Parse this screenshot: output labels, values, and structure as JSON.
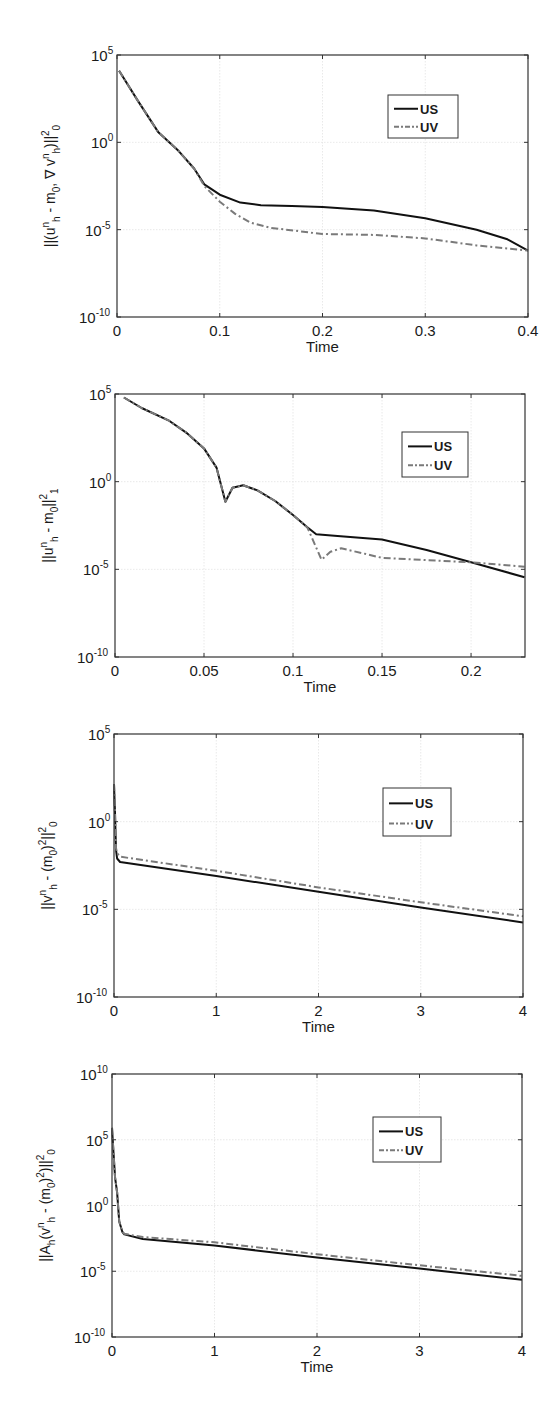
{
  "chart_data": [
    {
      "type": "line",
      "id": "chart1",
      "title": "",
      "xlabel": "Time",
      "ylabel": "||(u_h^n - m_0, ∇ v_h^n)||_0^2",
      "ylabel_parts": [
        {
          "t": "||(u",
          "s": "n"
        },
        {
          "t": "h",
          "sub": true
        },
        {
          "t": " - m"
        },
        {
          "t": "0",
          "sub": true
        },
        {
          "t": ", ∇ v",
          "s": "n"
        },
        {
          "t": "h",
          "sub": true
        },
        {
          "t": ")||",
          "s": "2"
        },
        {
          "t": "0",
          "sub": true
        }
      ],
      "yscale": "log",
      "xlim": [
        0,
        0.4
      ],
      "ylim_exp": [
        -10,
        5
      ],
      "xticks": [
        0,
        0.1,
        0.2,
        0.3,
        0.4
      ],
      "xtick_labels": [
        "0",
        "0.1",
        "0.2",
        "0.3",
        "0.4"
      ],
      "yticks_exp": [
        -10,
        -5,
        0,
        5
      ],
      "grid": true,
      "legend": {
        "position": "upper right",
        "entries": [
          "US",
          "UV"
        ]
      },
      "frame": {
        "x": 117,
        "y": 55,
        "w": 411,
        "h": 262
      },
      "legend_box": {
        "x": 388,
        "y": 95,
        "w": 70,
        "h": 43
      },
      "series": [
        {
          "name": "US",
          "style": "solid",
          "color": "#111111",
          "x": [
            0.002,
            0.02,
            0.04,
            0.06,
            0.075,
            0.085,
            0.1,
            0.12,
            0.14,
            0.17,
            0.2,
            0.25,
            0.3,
            0.35,
            0.38,
            0.4
          ],
          "log10y": [
            4.1,
            2.4,
            0.6,
            -0.5,
            -1.5,
            -2.4,
            -3.0,
            -3.45,
            -3.6,
            -3.65,
            -3.7,
            -3.9,
            -4.35,
            -5.0,
            -5.55,
            -6.2
          ]
        },
        {
          "name": "UV",
          "style": "dashdot",
          "color": "#7a7a7a",
          "x": [
            0.002,
            0.02,
            0.04,
            0.06,
            0.075,
            0.085,
            0.1,
            0.115,
            0.13,
            0.15,
            0.2,
            0.25,
            0.3,
            0.35,
            0.4
          ],
          "log10y": [
            4.1,
            2.4,
            0.6,
            -0.5,
            -1.5,
            -2.5,
            -3.4,
            -4.1,
            -4.6,
            -4.9,
            -5.25,
            -5.3,
            -5.5,
            -5.9,
            -6.2
          ]
        }
      ]
    },
    {
      "type": "line",
      "id": "chart2",
      "title": "",
      "xlabel": "Time",
      "ylabel": "||u_h^n - m_0||_1^2",
      "ylabel_parts": [
        {
          "t": "||u",
          "s": "n"
        },
        {
          "t": "h",
          "sub": true
        },
        {
          "t": " - m"
        },
        {
          "t": "0",
          "sub": true
        },
        {
          "t": "||",
          "s": "2"
        },
        {
          "t": "1",
          "sub": true
        }
      ],
      "yscale": "log",
      "xlim": [
        0,
        0.2303
      ],
      "ylim_exp": [
        -10,
        5
      ],
      "xticks": [
        0,
        0.05,
        0.1,
        0.15,
        0.2
      ],
      "xtick_labels": [
        "0",
        "0.05",
        "0.1",
        "0.15",
        "0.2"
      ],
      "yticks_exp": [
        -10,
        -5,
        0,
        5
      ],
      "grid": true,
      "legend": {
        "position": "upper right",
        "entries": [
          "US",
          "UV"
        ]
      },
      "frame": {
        "x": 115,
        "y": 394,
        "w": 410,
        "h": 263
      },
      "legend_box": {
        "x": 402,
        "y": 432,
        "w": 66,
        "h": 45
      },
      "series": [
        {
          "name": "US",
          "style": "solid",
          "color": "#111111",
          "x": [
            0.005,
            0.015,
            0.03,
            0.04,
            0.05,
            0.057,
            0.062,
            0.066,
            0.072,
            0.08,
            0.09,
            0.1,
            0.108,
            0.113,
            0.125,
            0.15,
            0.175,
            0.2,
            0.23
          ],
          "log10y": [
            4.8,
            4.2,
            3.5,
            2.8,
            1.9,
            0.8,
            -1.15,
            -0.35,
            -0.2,
            -0.5,
            -1.1,
            -1.9,
            -2.6,
            -3.0,
            -3.1,
            -3.3,
            -3.9,
            -4.6,
            -5.45
          ]
        },
        {
          "name": "UV",
          "style": "dashdot",
          "color": "#7a7a7a",
          "x": [
            0.005,
            0.015,
            0.03,
            0.04,
            0.05,
            0.057,
            0.062,
            0.066,
            0.072,
            0.08,
            0.09,
            0.1,
            0.108,
            0.116,
            0.121,
            0.127,
            0.14,
            0.15,
            0.18,
            0.2,
            0.23
          ],
          "log10y": [
            4.8,
            4.2,
            3.5,
            2.8,
            1.9,
            0.8,
            -1.15,
            -0.35,
            -0.2,
            -0.5,
            -1.1,
            -1.9,
            -2.6,
            -4.45,
            -4.0,
            -3.8,
            -4.1,
            -4.35,
            -4.5,
            -4.6,
            -4.85
          ]
        }
      ]
    },
    {
      "type": "line",
      "id": "chart3",
      "title": "",
      "xlabel": "Time",
      "ylabel": "||v_h^n - (m_0)^2||_0^2",
      "ylabel_parts": [
        {
          "t": "||v",
          "s": "n"
        },
        {
          "t": "h",
          "sub": true
        },
        {
          "t": " - (m"
        },
        {
          "t": "0",
          "sub": true
        },
        {
          "t": ")",
          "s": "2"
        },
        {
          "t": "||",
          "s": "2"
        },
        {
          "t": "0",
          "sub": true
        }
      ],
      "yscale": "log",
      "xlim": [
        0,
        4
      ],
      "ylim_exp": [
        -10,
        5
      ],
      "xticks": [
        0,
        1,
        2,
        3,
        4
      ],
      "xtick_labels": [
        "0",
        "1",
        "2",
        "3",
        "4"
      ],
      "yticks_exp": [
        -10,
        -5,
        0,
        5
      ],
      "grid": true,
      "legend": {
        "position": "upper right",
        "entries": [
          "US",
          "UV"
        ]
      },
      "frame": {
        "x": 114,
        "y": 734,
        "w": 409,
        "h": 263
      },
      "legend_box": {
        "x": 383,
        "y": 788,
        "w": 68,
        "h": 48
      },
      "series": [
        {
          "name": "US",
          "style": "solid",
          "color": "#111111",
          "x": [
            0.0,
            0.01,
            0.02,
            0.03,
            0.06,
            1,
            2,
            3,
            4
          ],
          "log10y": [
            2.15,
            0.5,
            -1.6,
            -2.1,
            -2.3,
            -3.1,
            -4.0,
            -4.9,
            -5.75
          ]
        },
        {
          "name": "UV",
          "style": "dashdot",
          "color": "#7a7a7a",
          "x": [
            0.0,
            0.01,
            0.02,
            0.03,
            0.06,
            1,
            2,
            3,
            4
          ],
          "log10y": [
            2.15,
            0.5,
            -1.5,
            -1.8,
            -2.0,
            -2.8,
            -3.75,
            -4.6,
            -5.4
          ]
        }
      ]
    },
    {
      "type": "line",
      "id": "chart4",
      "title": "",
      "xlabel": "Time",
      "ylabel": "||A_h(v_h^n - (m_0)^2)||_0^2",
      "ylabel_parts": [
        {
          "t": "||A"
        },
        {
          "t": "h",
          "sub": true
        },
        {
          "t": "(v",
          "s": "n"
        },
        {
          "t": "h",
          "sub": true
        },
        {
          "t": " - (m"
        },
        {
          "t": "0",
          "sub": true
        },
        {
          "t": ")",
          "s": "2"
        },
        {
          "t": ")||",
          "s": "2"
        },
        {
          "t": "0",
          "sub": true
        }
      ],
      "yscale": "log",
      "xlim": [
        0,
        4
      ],
      "ylim_exp": [
        -10,
        10
      ],
      "xticks": [
        0,
        1,
        2,
        3,
        4
      ],
      "xtick_labels": [
        "0",
        "1",
        "2",
        "3",
        "4"
      ],
      "yticks_exp": [
        -10,
        -5,
        0,
        5,
        10
      ],
      "grid": true,
      "legend": {
        "position": "upper right",
        "entries": [
          "US",
          "UV"
        ]
      },
      "frame": {
        "x": 112,
        "y": 1074,
        "w": 410,
        "h": 263
      },
      "legend_box": {
        "x": 373,
        "y": 1117,
        "w": 68,
        "h": 45
      },
      "series": [
        {
          "name": "US",
          "style": "solid",
          "color": "#111111",
          "x": [
            0.0,
            0.015,
            0.03,
            0.05,
            0.07,
            0.1,
            0.12,
            0.3,
            1,
            2,
            3,
            4
          ],
          "log10y": [
            5.9,
            4.0,
            2.1,
            1.0,
            -1.2,
            -2.0,
            -2.2,
            -2.55,
            -3.05,
            -3.95,
            -4.8,
            -5.65
          ]
        },
        {
          "name": "UV",
          "style": "dashdot",
          "color": "#7a7a7a",
          "x": [
            0.0,
            0.015,
            0.03,
            0.05,
            0.07,
            0.1,
            0.12,
            0.3,
            1,
            2,
            3,
            4
          ],
          "log10y": [
            5.9,
            4.0,
            2.1,
            1.0,
            -1.2,
            -2.0,
            -2.15,
            -2.4,
            -2.8,
            -3.7,
            -4.55,
            -5.35
          ]
        }
      ]
    }
  ]
}
